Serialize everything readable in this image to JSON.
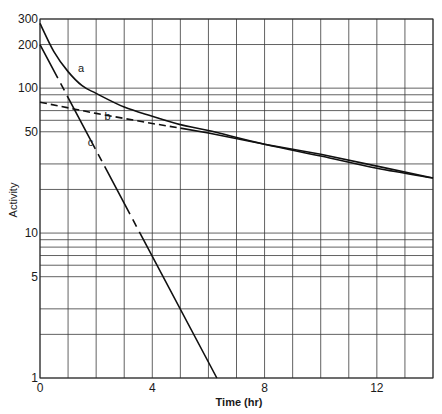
{
  "chart_data": {
    "type": "line",
    "title": "",
    "xlabel": "Time (hr)",
    "ylabel": "Activity",
    "xlim": [
      0,
      14
    ],
    "ylim": [
      1,
      300
    ],
    "yscale": "log",
    "grid": true,
    "x_ticks": [
      0,
      4,
      8,
      12
    ],
    "x_tick_labels": [
      "0",
      "4",
      "8",
      "12"
    ],
    "y_tick_labels": [
      {
        "value": 1,
        "label": "1"
      },
      {
        "value": 5,
        "label": "5"
      },
      {
        "value": 10,
        "label": "10"
      },
      {
        "value": 50,
        "label": "50"
      },
      {
        "value": 100,
        "label": "100"
      },
      {
        "value": 200,
        "label": "200"
      },
      {
        "value": 300,
        "label": "300"
      }
    ],
    "x_gridlines": [
      0,
      1,
      2,
      3,
      4,
      5,
      6,
      7,
      8,
      9,
      10,
      11,
      12,
      13,
      14
    ],
    "y_gridlines": [
      1,
      2,
      3,
      5,
      6,
      7,
      8,
      9,
      10,
      20,
      30,
      50,
      60,
      70,
      80,
      90,
      100,
      200,
      300
    ],
    "series": [
      {
        "name": "a",
        "style": "solid",
        "description": "Total activity (sum of b and c)",
        "x": [
          0,
          0.5,
          1,
          1.5,
          2,
          3,
          4,
          5,
          6,
          8,
          10,
          12,
          14
        ],
        "y": [
          280,
          178,
          130,
          104,
          92,
          74,
          64,
          56,
          51,
          41,
          34,
          28,
          24
        ]
      },
      {
        "name": "b",
        "style": "dashed-then-solid",
        "description": "Long-lived component, extrapolated to t=0 (dashed), t1/2 ~ 8 hr",
        "x": [
          0,
          2,
          4,
          5,
          6,
          8,
          10,
          12,
          14
        ],
        "y": [
          80,
          67,
          57,
          53,
          49,
          41,
          35,
          29,
          24
        ]
      },
      {
        "name": "c",
        "style": "solid-with-dashed-segments",
        "description": "Short-lived component (a minus b), t1/2 ~ 0.8 hr",
        "x": [
          0,
          1,
          2,
          3,
          4,
          5,
          6,
          6.3
        ],
        "y": [
          200,
          85,
          36,
          15,
          6.5,
          2.8,
          1.2,
          1
        ]
      }
    ],
    "annotations": [
      {
        "text": "a",
        "x": 1.35,
        "y": 130
      },
      {
        "text": "b",
        "x": 2.3,
        "y": 60
      },
      {
        "text": "c",
        "x": 1.7,
        "y": 40
      }
    ]
  }
}
